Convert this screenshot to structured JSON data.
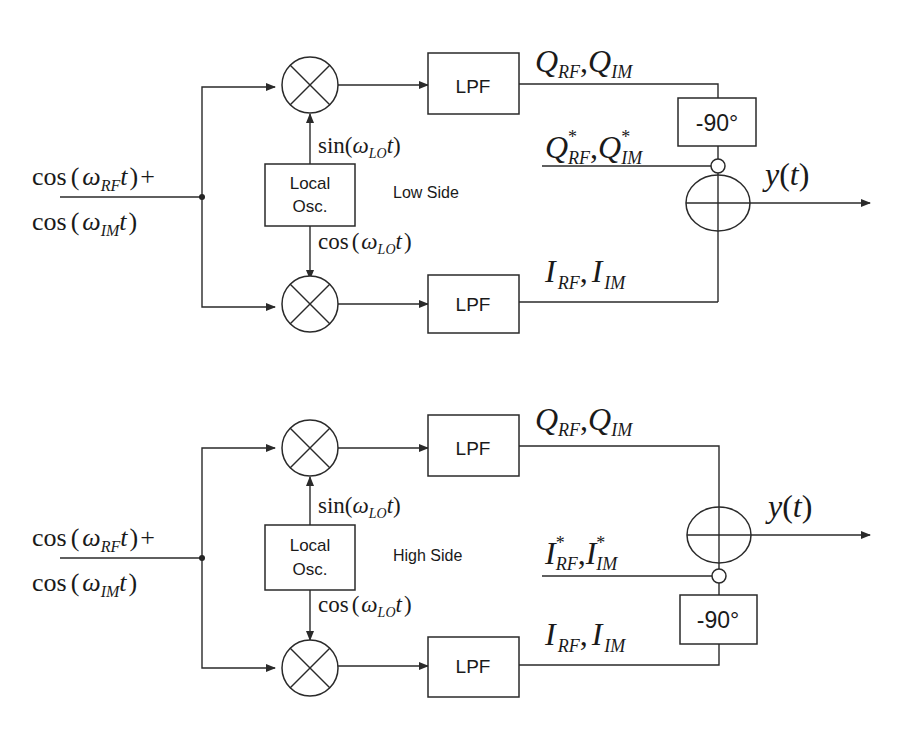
{
  "top_cutoff_text": "g  p  y",
  "diagrams": [
    {
      "id": "low-side",
      "mode_label": "Low Side",
      "input_label_line1": "cos(ω_RF t) +",
      "input_label_line2": "cos(ω_IM t)",
      "input": {
        "fn": "cos",
        "w": "ω",
        "sub1": "RF",
        "sub2": "IM",
        "var": "t",
        "plus": "+"
      },
      "lo": {
        "line1": "Local",
        "line2": "Osc.",
        "sin_fn": "sin",
        "cos_fn": "cos",
        "sub": "LO",
        "var": "t"
      },
      "lpf_label": "LPF",
      "phase_shift_label": "-90°",
      "q_label": {
        "a": "Q",
        "b": "Q",
        "sub_a": "RF",
        "sub_b": "IM"
      },
      "i_label": {
        "a": "I",
        "b": "I",
        "sub_a": "RF",
        "sub_b": "IM"
      },
      "conj_label": {
        "a": "Q",
        "b": "Q",
        "sub_a": "RF",
        "sub_b": "IM",
        "star": "*"
      },
      "output_label": "y(t)",
      "output": {
        "y": "y",
        "t": "t"
      }
    },
    {
      "id": "high-side",
      "mode_label": "High Side",
      "input_label_line1": "cos(ω_RF t) +",
      "input_label_line2": "cos(ω_IM t)",
      "input": {
        "fn": "cos",
        "w": "ω",
        "sub1": "RF",
        "sub2": "IM",
        "var": "t",
        "plus": "+"
      },
      "lo": {
        "line1": "Local",
        "line2": "Osc.",
        "sin_fn": "sin",
        "cos_fn": "cos",
        "sub": "LO",
        "var": "t"
      },
      "lpf_label": "LPF",
      "phase_shift_label": "-90°",
      "q_label": {
        "a": "Q",
        "b": "Q",
        "sub_a": "RF",
        "sub_b": "IM"
      },
      "i_label": {
        "a": "I",
        "b": "I",
        "sub_a": "RF",
        "sub_b": "IM"
      },
      "conj_label": {
        "a": "I",
        "b": "I",
        "sub_a": "RF",
        "sub_b": "IM",
        "star": "*"
      },
      "output_label": "y(t)",
      "output": {
        "y": "y",
        "t": "t"
      }
    }
  ],
  "colors": {
    "line": "#2a2a2a",
    "text": "#1a1a1a",
    "background": "#ffffff"
  }
}
